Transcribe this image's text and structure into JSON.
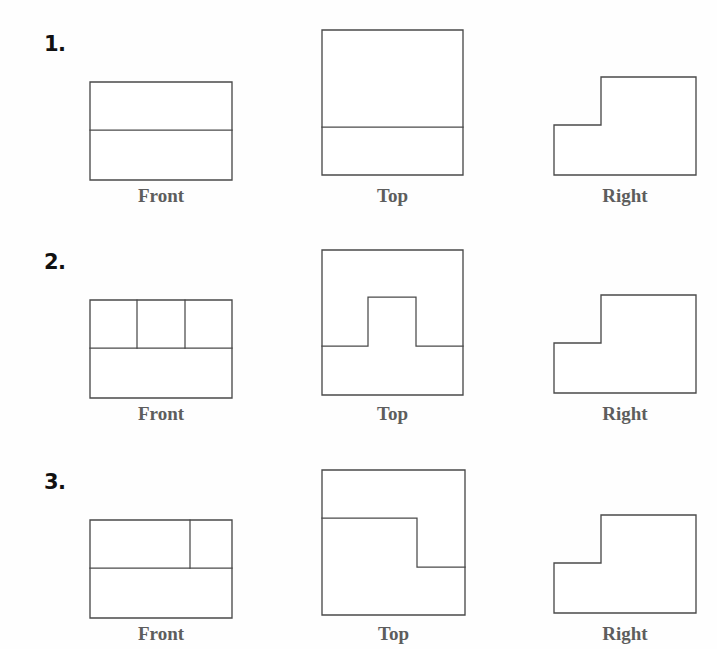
{
  "page": {
    "clipped_header_text": "",
    "line_color": "#4a4a4a",
    "label_color": "#5d5d5d",
    "number_color": "#111111",
    "background_color": "#ffffff"
  },
  "view_labels": {
    "front": "Front",
    "top": "Top",
    "right": "Right"
  },
  "problems": [
    {
      "number": "1.",
      "number_pos": {
        "x": 44,
        "y": 34
      },
      "views": {
        "front": {
          "label": "Front",
          "box": {
            "x": 90,
            "y": 82,
            "w": 142,
            "h": 98
          },
          "label_pos": {
            "x": 90,
            "y": 186,
            "w": 142
          },
          "shape": "rectangle-with-horizontal-divider",
          "outline": "M0,0 L142,0 L142,98 L0,98 Z",
          "dividers": [
            "M0,48 L142,48"
          ]
        },
        "top": {
          "label": "Top",
          "box": {
            "x": 322,
            "y": 30,
            "w": 141,
            "h": 145
          },
          "label_pos": {
            "x": 322,
            "y": 186,
            "w": 141
          },
          "shape": "square-with-horizontal-divider",
          "outline": "M0,0 L141,0 L141,145 L0,145 Z",
          "dividers": [
            "M0,97 L141,97"
          ]
        },
        "right": {
          "label": "Right",
          "box": {
            "x": 554,
            "y": 77,
            "w": 142,
            "h": 98
          },
          "label_pos": {
            "x": 554,
            "y": 186,
            "w": 142
          },
          "shape": "l-shape-step",
          "outline": "M0,48 L47,48 L47,0 L142,0 L142,98 L0,98 Z",
          "dividers": []
        }
      }
    },
    {
      "number": "2.",
      "number_pos": {
        "x": 44,
        "y": 252
      },
      "views": {
        "front": {
          "label": "Front",
          "box": {
            "x": 90,
            "y": 300,
            "w": 142,
            "h": 98
          },
          "label_pos": {
            "x": 90,
            "y": 404,
            "w": 142
          },
          "shape": "rectangle-with-divider-and-two-verticals",
          "outline": "M0,0 L142,0 L142,98 L0,98 Z",
          "dividers": [
            "M0,48 L142,48",
            "M47,0 L47,48",
            "M95,0 L95,48"
          ]
        },
        "top": {
          "label": "Top",
          "box": {
            "x": 322,
            "y": 250,
            "w": 141,
            "h": 145
          },
          "label_pos": {
            "x": 322,
            "y": 404,
            "w": 141
          },
          "shape": "square-with-tab-profile",
          "outline": "M0,0 L141,0 L141,145 L0,145 Z",
          "dividers": [
            "M0,96 L46,96 L46,47 L94,47 L94,96 L141,96"
          ]
        },
        "right": {
          "label": "Right",
          "box": {
            "x": 554,
            "y": 295,
            "w": 142,
            "h": 98
          },
          "label_pos": {
            "x": 554,
            "y": 404,
            "w": 142
          },
          "shape": "l-shape-step",
          "outline": "M0,48 L47,48 L47,0 L142,0 L142,98 L0,98 Z",
          "dividers": []
        }
      }
    },
    {
      "number": "3.",
      "number_pos": {
        "x": 44,
        "y": 472
      },
      "views": {
        "front": {
          "label": "Front",
          "box": {
            "x": 90,
            "y": 520,
            "w": 142,
            "h": 98
          },
          "label_pos": {
            "x": 90,
            "y": 624,
            "w": 142
          },
          "shape": "rectangle-with-divider-and-one-vertical",
          "outline": "M0,0 L142,0 L142,98 L0,98 Z",
          "dividers": [
            "M0,48 L142,48",
            "M100,0 L100,48"
          ]
        },
        "top": {
          "label": "Top",
          "box": {
            "x": 322,
            "y": 470,
            "w": 143,
            "h": 145
          },
          "label_pos": {
            "x": 322,
            "y": 624,
            "w": 143
          },
          "shape": "square-with-z-step-profile",
          "outline": "M0,0 L143,0 L143,145 L0,145 Z",
          "dividers": [
            "M0,48 L95,48 L95,97 L143,97"
          ]
        },
        "right": {
          "label": "Right",
          "box": {
            "x": 554,
            "y": 515,
            "w": 142,
            "h": 98
          },
          "label_pos": {
            "x": 554,
            "y": 624,
            "w": 142
          },
          "shape": "l-shape-step",
          "outline": "M0,48 L47,48 L47,0 L142,0 L142,98 L0,98 Z",
          "dividers": []
        }
      }
    }
  ]
}
